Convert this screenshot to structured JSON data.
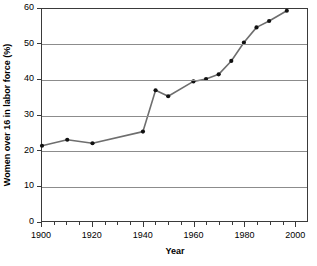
{
  "chart_data": {
    "type": "line",
    "title": "",
    "subtitle": "",
    "xlabel": "Year",
    "ylabel": "Women over 16 in labor force (%)",
    "xlim": [
      1900,
      2005
    ],
    "ylim": [
      0,
      60
    ],
    "grid": "horizontal",
    "legend": "none",
    "x_ticks": [
      1900,
      1920,
      1940,
      1960,
      1980,
      2000
    ],
    "x_tick_labels": [
      "1900",
      "1920",
      "1940",
      "1960",
      "1980",
      "2000"
    ],
    "x_minor_tick_step": 5,
    "y_ticks": [
      0,
      10,
      20,
      30,
      40,
      50,
      60
    ],
    "y_tick_labels": [
      "0",
      "10",
      "20",
      "30",
      "40",
      "50",
      "60"
    ],
    "marker": "filled-circle",
    "line_color": "#6e6e6e",
    "marker_color": "#111111",
    "grid_color": "#8c8c8c",
    "frame_color": "#3a3a3a",
    "x": [
      1900,
      1910,
      1920,
      1940,
      1945,
      1950,
      1960,
      1965,
      1970,
      1975,
      1980,
      1985,
      1990,
      1997
    ],
    "values": [
      21.3,
      23.0,
      22.0,
      25.3,
      37.0,
      35.3,
      39.5,
      40.2,
      41.5,
      45.3,
      50.5,
      54.8,
      56.6,
      59.5
    ],
    "series": [
      {
        "name": "Women over 16 in labor force",
        "x": [
          1900,
          1910,
          1920,
          1940,
          1945,
          1950,
          1960,
          1965,
          1970,
          1975,
          1980,
          1985,
          1990,
          1997
        ],
        "values": [
          21.3,
          23.0,
          22.0,
          25.3,
          37.0,
          35.3,
          39.5,
          40.2,
          41.5,
          45.3,
          50.5,
          54.8,
          56.6,
          59.5
        ]
      }
    ]
  }
}
